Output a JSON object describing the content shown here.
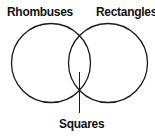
{
  "diagram": {
    "type": "venn",
    "sets": [
      {
        "label": "Rhombuses"
      },
      {
        "label": "Rectangles"
      }
    ],
    "intersection": {
      "label": "Squares"
    },
    "stroke_color": "#1a1a1a"
  }
}
